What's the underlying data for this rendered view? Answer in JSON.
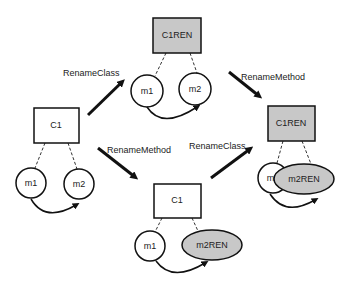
{
  "diagram": {
    "colors": {
      "stroke": "#111111",
      "renamed_fill": "#c8c8c8",
      "plain_fill": "#ffffff"
    },
    "states": {
      "initial": {
        "class": "C1",
        "methods": [
          "m1",
          "m2"
        ]
      },
      "after_rename_class": {
        "class": "C1REN",
        "methods": [
          "m1",
          "m2"
        ]
      },
      "after_rename_method": {
        "class": "C1",
        "methods": [
          "m1",
          "m2REN"
        ]
      },
      "final": {
        "class": "C1REN",
        "methods": [
          "m1",
          "m2REN"
        ]
      }
    },
    "transitions": [
      {
        "label": "RenameClass",
        "from": "initial",
        "to": "after_rename_class"
      },
      {
        "label": "RenameMethod",
        "from": "initial",
        "to": "after_rename_method"
      },
      {
        "label": "RenameMethod",
        "from": "after_rename_class",
        "to": "final"
      },
      {
        "label": "RenameClass",
        "from": "after_rename_method",
        "to": "final"
      }
    ]
  }
}
